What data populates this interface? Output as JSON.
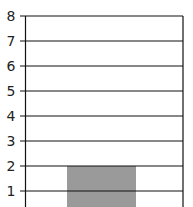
{
  "chart_data": {
    "type": "bar",
    "title": "",
    "xlabel": "",
    "ylabel": "",
    "categories": [
      ""
    ],
    "values": [
      2
    ],
    "ylim": [
      0,
      8
    ],
    "yticks": [
      "1",
      "2",
      "3",
      "4",
      "5",
      "6",
      "7",
      "8"
    ],
    "grid": true,
    "bar_color": "#9a9a9a",
    "grid_color": "#111111"
  }
}
